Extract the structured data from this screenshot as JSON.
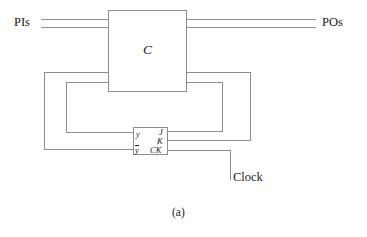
{
  "figure": {
    "caption": "(a)",
    "line_color": "#8d8d8d",
    "text_color": "#1a1a1a",
    "background": "#ffffff"
  },
  "labels": {
    "primary_inputs": "PIs",
    "primary_outputs": "POs",
    "combinational_block": "C",
    "clock": "Clock"
  },
  "flip_flop": {
    "output_y": "y",
    "output_y_bar": "y",
    "input_j": "J",
    "input_k": "K",
    "input_ck": "CK"
  },
  "diagram_geometry": {
    "c_box": {
      "x": 108,
      "y": 10,
      "w": 79,
      "h": 82
    },
    "ff_box": {
      "x": 133,
      "y": 127,
      "w": 35,
      "h": 28
    },
    "pi_lines_y": [
      19,
      27
    ],
    "po_lines_y": [
      19,
      27
    ],
    "c_feedback_in_y": [
      72,
      82
    ],
    "c_feedback_out_y": [
      72,
      82
    ]
  }
}
